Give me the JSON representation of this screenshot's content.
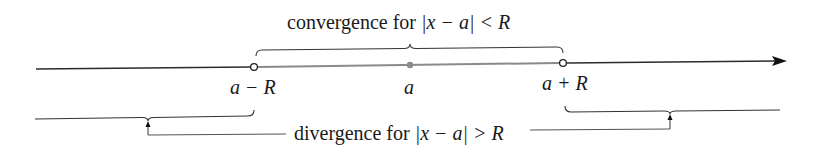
{
  "figure": {
    "top_label": {
      "text": "convergence for ",
      "math": "|x − a| < R"
    },
    "bottom_label": {
      "text": "divergence for ",
      "math": "|x − a| > R"
    },
    "points": [
      {
        "id": "left-endpoint",
        "label": "a − R",
        "style": "open-circle"
      },
      {
        "id": "center",
        "label": "a",
        "style": "filled-dot"
      },
      {
        "id": "right-endpoint",
        "label": "a + R",
        "style": "open-circle"
      }
    ],
    "colors": {
      "line": "#2a2a2a",
      "interval": "#8a8a8a",
      "text": "#1a1a1a"
    }
  }
}
